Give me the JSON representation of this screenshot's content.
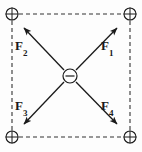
{
  "figure": {
    "background_color": "#fdfdfd",
    "stroke_color": "#1a1a1a",
    "dashed_color": "#333333"
  },
  "charges": [
    {
      "id": "charge-top-left",
      "symbol": "+",
      "sign": "positive",
      "x": 12,
      "y": 14,
      "radius": 6
    },
    {
      "id": "charge-top-right",
      "symbol": "+",
      "sign": "positive",
      "x": 130,
      "y": 14,
      "radius": 6
    },
    {
      "id": "charge-bottom-left",
      "symbol": "+",
      "sign": "positive",
      "x": 12,
      "y": 137,
      "radius": 6
    },
    {
      "id": "charge-bottom-right",
      "symbol": "+",
      "sign": "positive",
      "x": 130,
      "y": 137,
      "radius": 6
    },
    {
      "id": "charge-center",
      "symbol": "−",
      "sign": "negative",
      "x": 70,
      "y": 76,
      "radius": 7
    }
  ],
  "square": {
    "left": 12,
    "top": 14,
    "right": 130,
    "bottom": 137,
    "line_style": "dashed",
    "dash_pattern": "4 3"
  },
  "vectors": [
    {
      "id": "vector-F1",
      "label": "F",
      "subscript": "1",
      "direction": "up-right",
      "from": {
        "x": 76,
        "y": 70
      },
      "to": {
        "x": 117,
        "y": 28
      },
      "label_position": {
        "x": 101,
        "y": 39
      }
    },
    {
      "id": "vector-F2",
      "label": "F",
      "subscript": "2",
      "direction": "up-left",
      "from": {
        "x": 64,
        "y": 70
      },
      "to": {
        "x": 24,
        "y": 28
      },
      "label_position": {
        "x": 15,
        "y": 39
      }
    },
    {
      "id": "vector-F3",
      "label": "F",
      "subscript": "3",
      "direction": "down-left",
      "from": {
        "x": 64,
        "y": 82
      },
      "to": {
        "x": 24,
        "y": 124
      },
      "label_position": {
        "x": 15,
        "y": 99
      }
    },
    {
      "id": "vector-F4",
      "label": "F",
      "subscript": "4",
      "direction": "down-right",
      "from": {
        "x": 76,
        "y": 82
      },
      "to": {
        "x": 117,
        "y": 124
      },
      "label_position": {
        "x": 101,
        "y": 99
      }
    }
  ]
}
